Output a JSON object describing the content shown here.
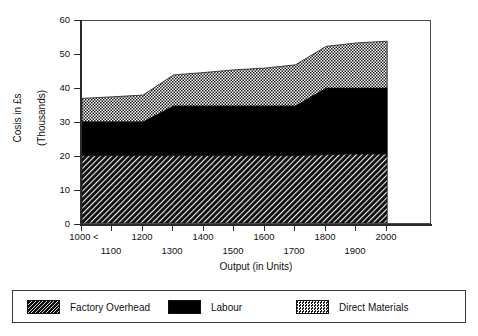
{
  "chart_data": {
    "type": "area",
    "title": "",
    "subtitle": "",
    "xlabel": "Output (in Units)",
    "ylabel": "Cosis in £s\n(Thousands)",
    "ylabel_line1": "Cosis in £s",
    "ylabel_line2": "(Thousands)",
    "stacked": true,
    "grid": false,
    "legend_position": "bottom",
    "xlim": [
      1000,
      2000
    ],
    "ylim": [
      0,
      60
    ],
    "yticks": [
      0,
      10,
      20,
      30,
      40,
      50,
      60
    ],
    "ytick_labels": [
      "0",
      "10",
      "20",
      "30",
      "40",
      "50",
      "60"
    ],
    "xticks": [
      1000,
      1100,
      1200,
      1300,
      1400,
      1500,
      1600,
      1700,
      1800,
      1900,
      2000
    ],
    "xtick_labels_row1": [
      "1000 <",
      "1200",
      "1400",
      "1600",
      "1800",
      "2000"
    ],
    "xtick_labels_row2": [
      "1100",
      "1300",
      "1500",
      "1700",
      "1900"
    ],
    "x": [
      1000,
      1100,
      1200,
      1300,
      1400,
      1500,
      1600,
      1700,
      1800,
      1900,
      2000
    ],
    "series": [
      {
        "name": "Factory Overhead",
        "pattern": "diagonal-hatch",
        "color": "#0d0d0d",
        "values": [
          20,
          20,
          20,
          20,
          20,
          20,
          20,
          20,
          20.3,
          20.5,
          20.5
        ]
      },
      {
        "name": "Labour",
        "pattern": "solid-black",
        "color": "#000000",
        "values": [
          10,
          10,
          10,
          14.7,
          14.7,
          14.7,
          14.7,
          14.7,
          19.7,
          19.5,
          19.5
        ]
      },
      {
        "name": "Direct Materials",
        "pattern": "checkerboard",
        "color": "#bfbfbf",
        "values": [
          7,
          7.5,
          8,
          9.3,
          10,
          10.8,
          11.3,
          12.3,
          12.5,
          13.5,
          14
        ]
      }
    ],
    "cumulative": {
      "factory_overhead_top": [
        20,
        20,
        20,
        20,
        20,
        20,
        20,
        20,
        20.3,
        20.5,
        20.5
      ],
      "labour_top": [
        30,
        30,
        30,
        34.7,
        34.7,
        34.7,
        34.7,
        34.7,
        40,
        40,
        40
      ],
      "total_top": [
        37,
        37.5,
        38,
        44,
        44.7,
        45.5,
        46,
        47,
        52.5,
        53.5,
        54
      ]
    }
  },
  "legend": {
    "items": [
      {
        "label": "Factory Overhead",
        "swatch": "diagonal-hatch"
      },
      {
        "label": "Labour",
        "swatch": "solid-black"
      },
      {
        "label": "Direct Materials",
        "swatch": "checkerboard"
      }
    ]
  },
  "axes": {
    "x_title": "Output (in Units)",
    "y_title_line1": "Cosis in £s",
    "y_title_line2": "(Thousands)"
  }
}
